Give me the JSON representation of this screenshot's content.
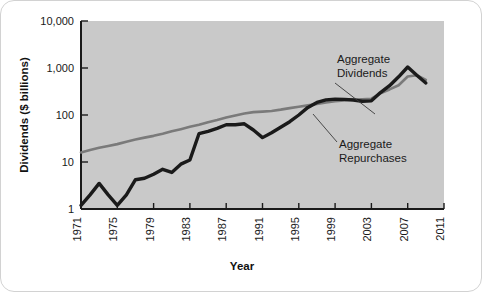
{
  "chart_data": {
    "type": "line",
    "title": "",
    "xlabel": "Year",
    "ylabel": "Dividends ($ billions)",
    "yscale": "log",
    "ylim": [
      1,
      10000
    ],
    "xlim": [
      1971,
      2011
    ],
    "grid": false,
    "legend_position": "inline-annotations",
    "plot_background": "#c9c9c9",
    "ytick_labels": [
      "10,000",
      "1,000",
      "100",
      "10",
      "1"
    ],
    "ytick_values": [
      10000,
      1000,
      100,
      10,
      1
    ],
    "xtick_labels": [
      "1971",
      "1975",
      "1979",
      "1983",
      "1987",
      "1991",
      "1995",
      "1999",
      "2003",
      "2007",
      "2011"
    ],
    "xtick_values": [
      1971,
      1975,
      1979,
      1983,
      1987,
      1991,
      1995,
      1999,
      2003,
      2007,
      2011
    ],
    "annotations": [
      {
        "id": "dividends-annotation",
        "text_line1": "Aggregate",
        "text_line2": "Dividends"
      },
      {
        "id": "repurchases-annotation",
        "text_line1": "Aggregate",
        "text_line2": "Repurchases"
      }
    ],
    "series": [
      {
        "name": "Aggregate Dividends",
        "color": "#7a7a7a",
        "x": [
          1971,
          1972,
          1973,
          1974,
          1975,
          1976,
          1977,
          1978,
          1979,
          1980,
          1981,
          1982,
          1983,
          1984,
          1985,
          1986,
          1987,
          1988,
          1989,
          1990,
          1991,
          1992,
          1993,
          1994,
          1995,
          1996,
          1997,
          1998,
          1999,
          2000,
          2001,
          2002,
          2003,
          2004,
          2005,
          2006,
          2007,
          2008,
          2009
        ],
        "values": [
          16,
          18,
          20,
          22,
          24,
          27,
          30,
          33,
          36,
          40,
          45,
          50,
          56,
          62,
          70,
          78,
          88,
          98,
          108,
          115,
          118,
          122,
          130,
          140,
          150,
          160,
          172,
          185,
          196,
          205,
          212,
          216,
          222,
          290,
          350,
          430,
          660,
          700,
          560
        ]
      },
      {
        "name": "Aggregate Repurchases",
        "color": "#1a1a1a",
        "x": [
          1971,
          1972,
          1973,
          1974,
          1975,
          1976,
          1977,
          1978,
          1979,
          1980,
          1981,
          1982,
          1983,
          1984,
          1985,
          1986,
          1987,
          1988,
          1989,
          1990,
          1991,
          1992,
          1993,
          1994,
          1995,
          1996,
          1997,
          1998,
          1999,
          2000,
          2001,
          2002,
          2003,
          2004,
          2005,
          2006,
          2007,
          2008,
          2009
        ],
        "values": [
          1.2,
          2.0,
          3.5,
          2.0,
          1.2,
          2.0,
          4.2,
          4.5,
          5.5,
          7.0,
          6.0,
          9.0,
          11.0,
          40.0,
          45.0,
          52.0,
          62.0,
          62.0,
          65.0,
          48.0,
          33.0,
          42.0,
          55.0,
          72.0,
          100.0,
          145.0,
          185.0,
          210.0,
          218.0,
          215.0,
          208.0,
          196.0,
          200.0,
          300.0,
          420.0,
          650.0,
          1050.0,
          700.0,
          480.0
        ]
      }
    ]
  }
}
